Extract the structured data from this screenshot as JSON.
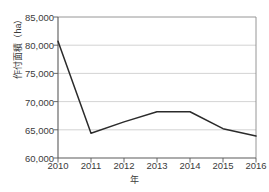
{
  "chart_data": {
    "type": "line",
    "title": "",
    "xlabel": "年",
    "ylabel": "作付面積（ha）",
    "categories": [
      "2010",
      "2011",
      "2012",
      "2013",
      "2014",
      "2015",
      "2016"
    ],
    "x": [
      2010,
      2011,
      2012,
      2013,
      2014,
      2015,
      2016
    ],
    "values": [
      80700,
      64400,
      66400,
      68200,
      68200,
      65200,
      63900
    ],
    "series": [
      {
        "name": "作付面積",
        "values": [
          80700,
          64400,
          66400,
          68200,
          68200,
          65200,
          63900
        ]
      }
    ],
    "ylim": [
      60000,
      85000
    ],
    "ytick_values": [
      85000,
      80000,
      75000,
      70000,
      65000,
      60000
    ],
    "ytick_labels": [
      "85,000",
      "80,000",
      "75,000",
      "70,000",
      "65,000",
      "60,000"
    ],
    "xtick_labels": [
      "2010",
      "2011",
      "2012",
      "2013",
      "2014",
      "2015",
      "2016"
    ],
    "grid": "horizontal",
    "legend": "none",
    "line_color": "#2b2b2b",
    "grid_color": "#c8c8c8",
    "axis_color": "#7a7a7a",
    "background_color": "#ffffff"
  }
}
